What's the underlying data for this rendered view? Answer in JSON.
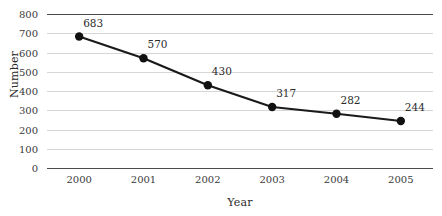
{
  "chart_data": {
    "type": "line",
    "title": "",
    "xlabel": "Year",
    "ylabel": "Number",
    "categories": [
      "2000",
      "2001",
      "2002",
      "2003",
      "2004",
      "2005"
    ],
    "values": [
      683,
      570,
      430,
      317,
      282,
      244
    ],
    "data_labels": [
      "683",
      "570",
      "430",
      "317",
      "282",
      "244"
    ],
    "ylim": [
      0,
      800
    ],
    "y_ticks": [
      0,
      100,
      200,
      300,
      400,
      500,
      600,
      700,
      800
    ],
    "y_tick_labels": [
      "0",
      "100",
      "200",
      "300",
      "400",
      "500",
      "600",
      "700",
      "800"
    ],
    "grid": true,
    "legend": false,
    "series_color": "#1a1a1a",
    "marker": "circle",
    "marker_color": "#111111",
    "gridline_color": "#d6d6d6",
    "axis_color": "#4a4a4a",
    "background_color": "#ffffff",
    "text_color": "#2b2b2b"
  }
}
